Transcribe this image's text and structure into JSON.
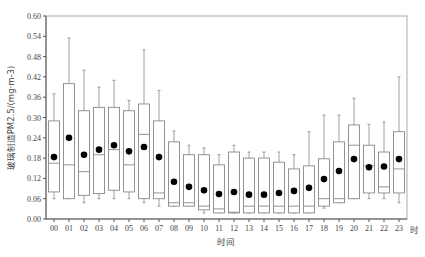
{
  "chart_data": {
    "type": "box",
    "title": "",
    "xlabel": "时间",
    "x_unit_label": "时",
    "ylabel": "玻璃制造PM2.5/(mg·m-3)",
    "ylim": [
      0.0,
      0.6
    ],
    "yticks": [
      "0.00",
      "0.06",
      "0.12",
      "0.18",
      "0.24",
      "0.30",
      "0.36",
      "0.42",
      "0.48",
      "0.54",
      "0.60"
    ],
    "grid": false,
    "legend": null,
    "categories": [
      "00",
      "01",
      "02",
      "03",
      "04",
      "05",
      "06",
      "07",
      "08",
      "09",
      "10",
      "11",
      "12",
      "13",
      "14",
      "15",
      "16",
      "17",
      "18",
      "19",
      "20",
      "21",
      "22",
      "23"
    ],
    "series": [
      {
        "name": "whisker_low",
        "values": [
          0.06,
          0.06,
          0.048,
          0.06,
          0.06,
          0.06,
          0.048,
          0.038,
          0.038,
          0.038,
          0.018,
          0.018,
          0.018,
          0.018,
          0.018,
          0.018,
          0.018,
          0.018,
          0.032,
          0.048,
          0.06,
          0.06,
          0.06,
          0.048
        ]
      },
      {
        "name": "q1",
        "values": [
          0.08,
          0.06,
          0.07,
          0.075,
          0.085,
          0.08,
          0.06,
          0.06,
          0.038,
          0.038,
          0.027,
          0.018,
          0.018,
          0.018,
          0.018,
          0.018,
          0.018,
          0.018,
          0.038,
          0.048,
          0.06,
          0.077,
          0.077,
          0.077
        ]
      },
      {
        "name": "median",
        "values": [
          0.165,
          0.16,
          0.14,
          0.19,
          0.205,
          0.16,
          0.25,
          0.077,
          0.048,
          0.048,
          0.038,
          0.03,
          0.02,
          0.038,
          0.038,
          0.038,
          0.038,
          0.038,
          0.06,
          0.06,
          0.218,
          0.157,
          0.095,
          0.148
        ]
      },
      {
        "name": "q3",
        "values": [
          0.29,
          0.4,
          0.32,
          0.33,
          0.33,
          0.32,
          0.34,
          0.29,
          0.228,
          0.19,
          0.19,
          0.16,
          0.198,
          0.18,
          0.18,
          0.168,
          0.148,
          0.157,
          0.178,
          0.228,
          0.278,
          0.218,
          0.198,
          0.258
        ]
      },
      {
        "name": "whisker_high",
        "values": [
          0.37,
          0.535,
          0.44,
          0.39,
          0.41,
          0.35,
          0.5,
          0.38,
          0.26,
          0.218,
          0.21,
          0.19,
          0.218,
          0.198,
          0.198,
          0.198,
          0.19,
          0.258,
          0.307,
          0.307,
          0.357,
          0.28,
          0.287,
          0.42
        ]
      },
      {
        "name": "mean",
        "values": [
          0.183,
          0.24,
          0.19,
          0.205,
          0.218,
          0.2,
          0.213,
          0.183,
          0.11,
          0.095,
          0.085,
          0.074,
          0.08,
          0.072,
          0.072,
          0.077,
          0.083,
          0.092,
          0.118,
          0.142,
          0.177,
          0.153,
          0.155,
          0.177
        ]
      }
    ]
  },
  "colors": {
    "axis": "#555555",
    "box_stroke": "#888888",
    "mean_dot": "#000000",
    "background": "#ffffff"
  }
}
